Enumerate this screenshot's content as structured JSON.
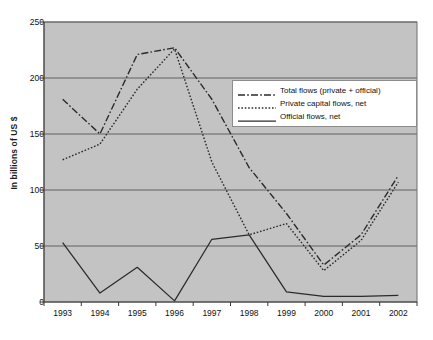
{
  "chart_data": {
    "type": "line",
    "title": "",
    "xlabel": "",
    "ylabel": "In billions of US $",
    "categories": [
      "1993",
      "1994",
      "1995",
      "1996",
      "1997",
      "1998",
      "1999",
      "2000",
      "2001",
      "2002"
    ],
    "ylim": [
      0,
      250
    ],
    "ytick_values": [
      0,
      50,
      100,
      150,
      200,
      250
    ],
    "ytick_labels": [
      "0",
      "50",
      "100",
      "150",
      "200",
      "250"
    ],
    "grid": true,
    "legend_position": "upper right",
    "plot_background": "#c3c3c3",
    "series": [
      {
        "name": "Total flows (private + official)",
        "style": "dash-dot",
        "color": "#2b2b2b",
        "values": [
          181,
          150,
          221,
          227,
          181,
          120,
          79,
          33,
          60,
          113
        ]
      },
      {
        "name": "Private capital flows, net",
        "style": "dotted",
        "color": "#2b2b2b",
        "values": [
          127,
          141,
          190,
          226,
          125,
          60,
          70,
          28,
          55,
          107
        ]
      },
      {
        "name": "Official flows, net",
        "style": "solid",
        "color": "#2b2b2b",
        "values": [
          53,
          8,
          31,
          1,
          56,
          60,
          9,
          5,
          5,
          6
        ]
      }
    ]
  },
  "legend": {
    "items": [
      {
        "label": "Total flows (private + official)",
        "sample": "dash-dot-line-icon"
      },
      {
        "label": "Private capital flows, net",
        "sample": "dotted-line-icon"
      },
      {
        "label": "Official flows, net",
        "sample": "solid-line-icon"
      }
    ]
  }
}
